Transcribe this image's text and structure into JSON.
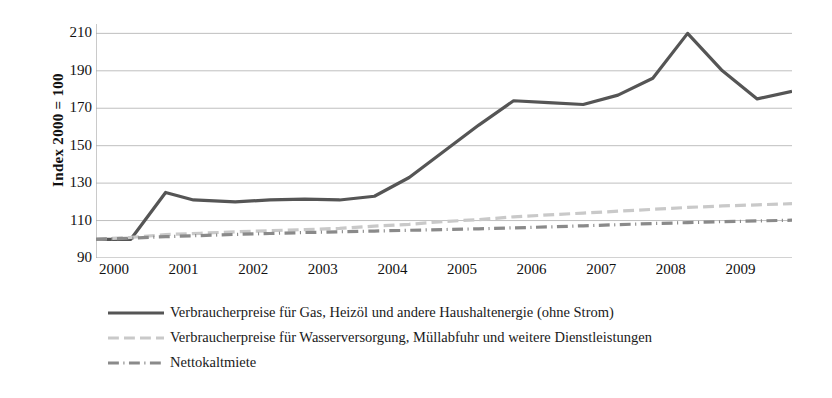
{
  "chart_data": {
    "type": "line",
    "title": "",
    "subtitle": "",
    "xlabel": "",
    "ylabel": "Index 2000 = 100",
    "ylim": [
      90,
      215
    ],
    "yticks": [
      90,
      110,
      130,
      150,
      170,
      190,
      210
    ],
    "xlim": [
      2000,
      2010
    ],
    "categories": [
      "2000",
      "2001",
      "2002",
      "2003",
      "2004",
      "2005",
      "2006",
      "2007",
      "2008",
      "2009"
    ],
    "grid": "horizontal",
    "legend_position": "bottom-left",
    "series": [
      {
        "name": "Verbraucherpreise für Gas, Heizöl und andere Haushaltenergie (ohne Strom)",
        "color": "#555555",
        "style": "solid",
        "width": 3.2,
        "x": [
          2000.0,
          2000.5,
          2001.0,
          2001.4,
          2002.0,
          2002.5,
          2003.0,
          2003.5,
          2004.0,
          2004.5,
          2005.0,
          2005.5,
          2006.0,
          2006.5,
          2007.0,
          2007.5,
          2008.0,
          2008.5,
          2009.0,
          2009.5,
          2010.0
        ],
        "values": [
          100,
          100,
          125,
          121,
          120,
          121,
          121.5,
          121,
          123,
          133,
          147,
          161,
          174,
          173,
          172,
          177,
          186,
          210,
          190,
          175,
          179
        ]
      },
      {
        "name": "Verbraucherpreise für Wasserversorgung, Müllabfuhr und weitere Dienstleistungen",
        "color": "#c9c9c9",
        "style": "dashed",
        "width": 3.2,
        "x": [
          2000.0,
          2000.5,
          2001.0,
          2001.5,
          2002.0,
          2002.5,
          2003.0,
          2003.5,
          2004.0,
          2004.5,
          2005.0,
          2005.5,
          2006.0,
          2006.5,
          2007.0,
          2007.5,
          2008.0,
          2008.5,
          2009.0,
          2009.5,
          2010.0
        ],
        "values": [
          100,
          101,
          102.5,
          103.2,
          104,
          104.6,
          105.2,
          105.8,
          107,
          108,
          109.5,
          110.5,
          112,
          113,
          114,
          115,
          116,
          117,
          117.8,
          118.4,
          119
        ]
      },
      {
        "name": "Nettokaltmiete",
        "color": "#8a8a8a",
        "style": "dash-dot",
        "width": 3.2,
        "x": [
          2000.0,
          2000.5,
          2001.0,
          2001.5,
          2002.0,
          2002.5,
          2003.0,
          2003.5,
          2004.0,
          2004.5,
          2005.0,
          2005.5,
          2006.0,
          2006.5,
          2007.0,
          2007.5,
          2008.0,
          2008.5,
          2009.0,
          2009.5,
          2010.0
        ],
        "values": [
          100,
          100.6,
          101.4,
          102.0,
          102.6,
          103.1,
          103.6,
          104.0,
          104.4,
          104.8,
          105.2,
          105.6,
          106.1,
          106.6,
          107.2,
          107.8,
          108.4,
          108.9,
          109.4,
          109.8,
          110.2
        ]
      }
    ]
  },
  "axis": {
    "y_title": "Index 2000 = 100",
    "y_tick_labels": [
      "210",
      "190",
      "170",
      "150",
      "130",
      "110",
      "90"
    ],
    "x_tick_labels": [
      "2000",
      "2001",
      "2002",
      "2003",
      "2004",
      "2005",
      "2006",
      "2007",
      "2008",
      "2009"
    ]
  },
  "legend": {
    "items": [
      {
        "label": "Verbraucherpreise für Gas, Heizöl und andere Haushaltenergie (ohne Strom)",
        "color": "#555555",
        "style": "solid"
      },
      {
        "label": "Verbraucherpreise für Wasserversorgung, Müllabfuhr und weitere Dienstleistungen",
        "color": "#c9c9c9",
        "style": "dashed"
      },
      {
        "label": "Nettokaltmiete",
        "color": "#8a8a8a",
        "style": "dash-dot"
      }
    ]
  },
  "colors": {
    "gridline": "#bfbfbf",
    "axis": "#a6a6a6",
    "text": "#111111",
    "background": "#ffffff"
  }
}
